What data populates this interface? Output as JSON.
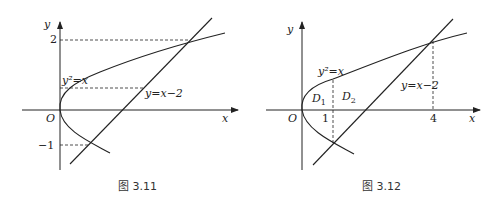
{
  "figures": [
    {
      "caption": "图 3.11",
      "axis_x": "x",
      "axis_y": "y",
      "origin": "O",
      "curve_label": "y²=x",
      "line_label": "y=x−2",
      "y_ticks": [
        "2",
        "−1"
      ]
    },
    {
      "caption": "图 3.12",
      "axis_x": "x",
      "axis_y": "y",
      "origin": "O",
      "curve_label": "y²=x",
      "line_label": "y=x−2",
      "x_ticks": [
        "1",
        "4"
      ],
      "region_1": "D",
      "region_1_sub": "1",
      "region_2": "D",
      "region_2_sub": "2"
    }
  ]
}
